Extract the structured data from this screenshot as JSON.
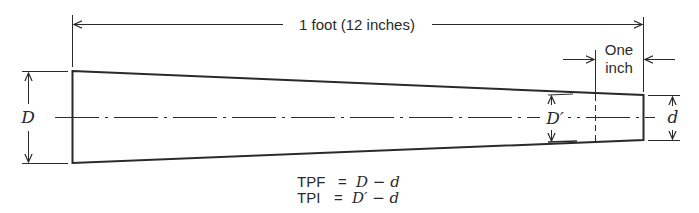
{
  "diagram": {
    "type": "taper-dimension-diagram",
    "overall_length_label": "1 foot (12 inches)",
    "one_inch_label": [
      "One",
      "inch"
    ],
    "large_diameter_label": "D",
    "one_inch_diameter_label": "D′",
    "small_diameter_label": "d",
    "formulas": [
      {
        "lhs": "TPF",
        "eq": "=",
        "rhs": "D − d"
      },
      {
        "lhs": "TPI",
        "eq": "=",
        "rhs": "D′ − d"
      }
    ],
    "colors": {
      "line": "#2a2a2a",
      "background": "#ffffff"
    }
  }
}
